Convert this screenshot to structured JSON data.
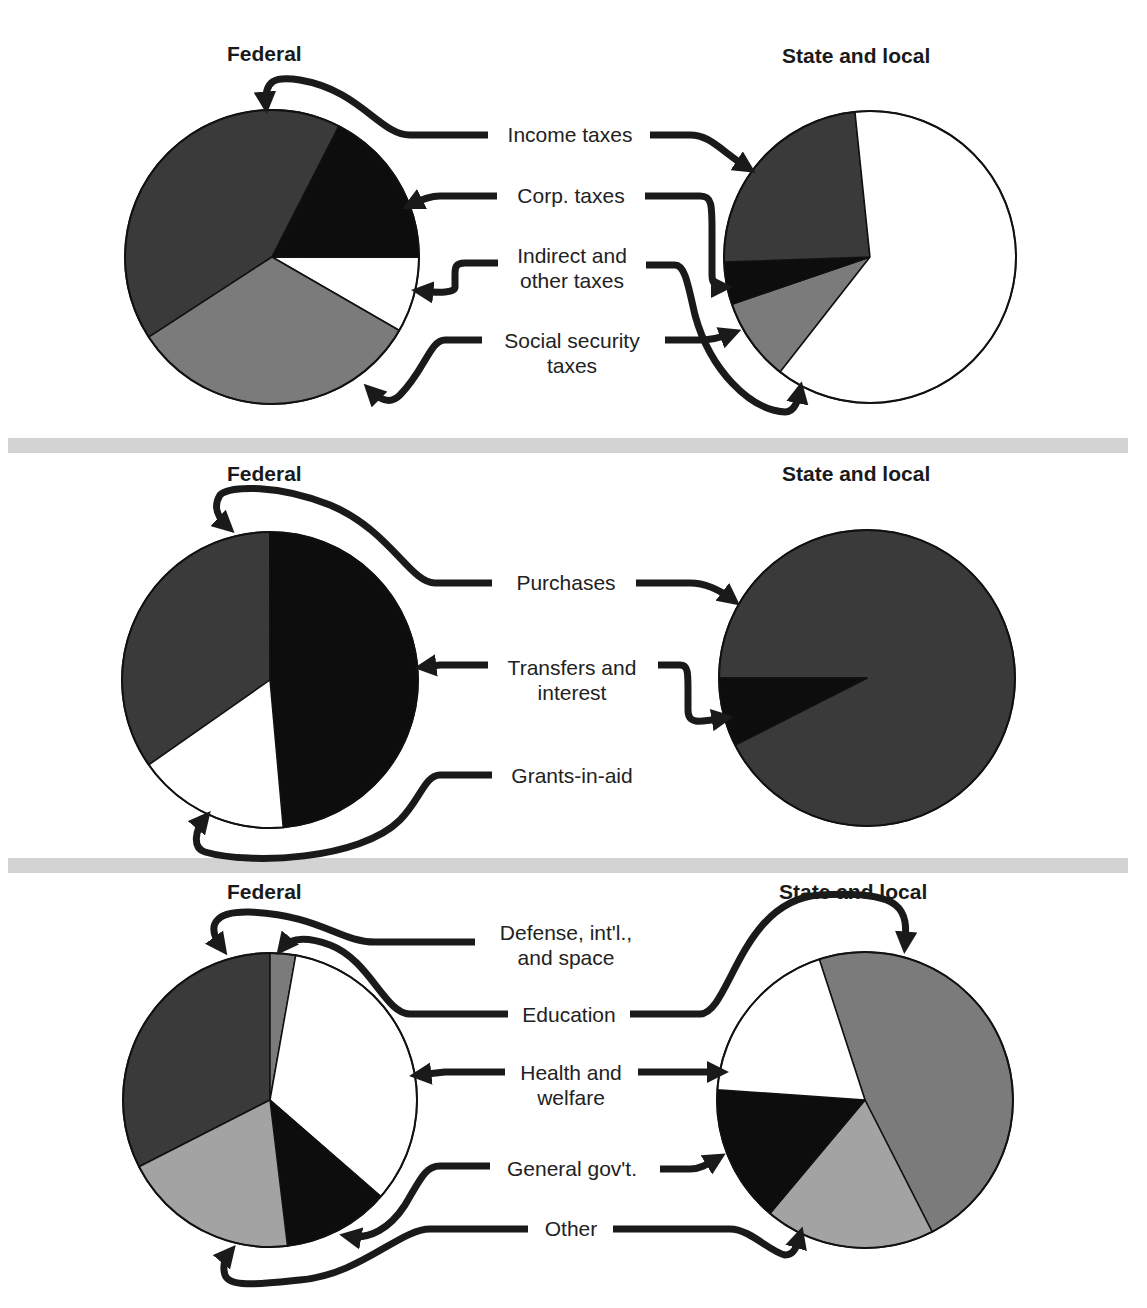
{
  "colors": {
    "dark_gray": "#3a3a3a",
    "black": "#0d0d0d",
    "white": "#ffffff",
    "mid_gray": "#7b7b7b",
    "light_gray": "#a3a3a3",
    "separator": "#d3d3d3",
    "outline": "#111111"
  },
  "panels": [
    {
      "federal_title": "Federal",
      "state_title": "State and local",
      "labels": [
        "Income taxes",
        "Corp. taxes",
        "Indirect and\nother taxes",
        "Social security\ntaxes"
      ]
    },
    {
      "federal_title": "Federal",
      "state_title": "State and local",
      "labels": [
        "Purchases",
        "Transfers and\ninterest",
        "Grants-in-aid"
      ]
    },
    {
      "federal_title": "Federal",
      "state_title": "State and local",
      "labels": [
        "Defense, int'l.,\nand space",
        "Education",
        "Health and\nwelfare",
        "General gov't.",
        "Other"
      ]
    }
  ],
  "chart_data": [
    {
      "type": "pie",
      "title": "Federal",
      "section": "Receipts",
      "categories": [
        "Income taxes",
        "Corp. taxes",
        "Indirect and other taxes",
        "Social security taxes"
      ],
      "values": [
        41.7,
        17.5,
        8.3,
        32.5
      ],
      "fills": [
        "#3a3a3a",
        "#0d0d0d",
        "#ffffff",
        "#7b7b7b"
      ],
      "start_angle_deg": 237,
      "center": [
        272,
        257
      ],
      "radius": 147
    },
    {
      "type": "pie",
      "title": "State and local",
      "section": "Receipts",
      "categories": [
        "Income taxes",
        "Corp. taxes",
        "Indirect and other taxes",
        "Social security taxes"
      ],
      "values": [
        23.9,
        4.7,
        62.2,
        9.2
      ],
      "fills": [
        "#3a3a3a",
        "#0d0d0d",
        "#ffffff",
        "#7b7b7b"
      ],
      "order": [
        3,
        1,
        0,
        2
      ],
      "start_angle_deg": 218,
      "center": [
        870,
        257
      ],
      "radius": 146
    },
    {
      "type": "pie",
      "title": "Federal",
      "section": "Expenditures by type",
      "categories": [
        "Purchases",
        "Transfers and interest",
        "Grants-in-aid"
      ],
      "values": [
        34.7,
        48.6,
        16.7
      ],
      "fills": [
        "#3a3a3a",
        "#0d0d0d",
        "#ffffff"
      ],
      "start_angle_deg": 235,
      "center": [
        270,
        680
      ],
      "radius": 148
    },
    {
      "type": "pie",
      "title": "State and local",
      "section": "Expenditures by type",
      "categories": [
        "Purchases",
        "Transfers and interest",
        "Grants-in-aid"
      ],
      "values": [
        92.5,
        7.5,
        0
      ],
      "fills": [
        "#3a3a3a",
        "#0d0d0d",
        "#ffffff"
      ],
      "start_angle_deg": 270,
      "center": [
        867,
        678
      ],
      "radius": 148
    },
    {
      "type": "pie",
      "title": "Federal",
      "section": "Expenditures by function",
      "categories": [
        "Defense, int'l., and space",
        "Education",
        "Health and welfare",
        "General gov't.",
        "Other"
      ],
      "values": [
        32.5,
        2.8,
        33.6,
        11.7,
        19.4
      ],
      "fills": [
        "#3a3a3a",
        "#7b7b7b",
        "#ffffff",
        "#0d0d0d",
        "#a3a3a3"
      ],
      "start_angle_deg": 243,
      "center": [
        270,
        1100
      ],
      "radius": 147
    },
    {
      "type": "pie",
      "title": "State and local",
      "section": "Expenditures by function",
      "categories": [
        "Defense, int'l., and space",
        "Education",
        "Health and welfare",
        "General gov't.",
        "Other"
      ],
      "values": [
        0,
        47.5,
        18.9,
        15.0,
        18.6
      ],
      "fills": [
        "#3a3a3a",
        "#7b7b7b",
        "#ffffff",
        "#0d0d0d",
        "#a3a3a3"
      ],
      "order": [
        1,
        4,
        3,
        2,
        0
      ],
      "start_angle_deg": 342,
      "center": [
        865,
        1100
      ],
      "radius": 148
    }
  ]
}
